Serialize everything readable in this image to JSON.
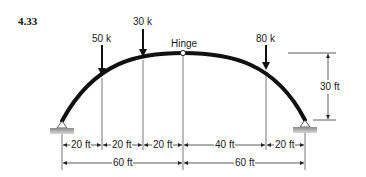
{
  "problem_number": "4.33",
  "arch": {
    "type": "three-hinged arch",
    "hinge_label": "Hinge",
    "rise_label": "30 ft"
  },
  "loads": [
    {
      "label": "50 k",
      "position_ft_from_left": 20
    },
    {
      "label": "30 k",
      "position_ft_from_left": 40
    },
    {
      "label": "80 k",
      "position_ft_from_left": 100
    }
  ],
  "dimensions": {
    "segments": [
      "20 ft",
      "20 ft",
      "20 ft",
      "40 ft",
      "20 ft"
    ],
    "halves": [
      "60 ft",
      "60 ft"
    ]
  },
  "colors": {
    "arch": "#111111",
    "lines": "#333333",
    "support_fill": "#9a9a9a"
  }
}
